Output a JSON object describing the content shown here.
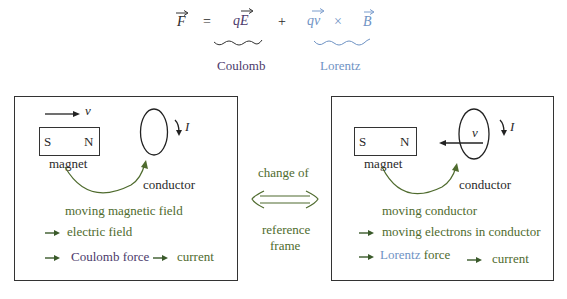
{
  "equation": {
    "lhs": "F",
    "equals": "=",
    "term1": "qE",
    "plus": "+",
    "term2a": "qv",
    "times": "×",
    "term2b": "B",
    "label1": "Coulomb",
    "label2": "Lorentz"
  },
  "colors": {
    "coulomb": "#4b3a6b",
    "lorentz": "#6f93c4",
    "green_text": "#4f6b2e",
    "dark": "#2a2a2a"
  },
  "left_panel": {
    "velocity_label": "v",
    "magnet_south": "S",
    "magnet_north": "N",
    "magnet_label": "magnet",
    "conductor_label": "conductor",
    "current_label": "I",
    "line1": "moving magnetic field",
    "line2": "electric field",
    "line3_force": "Coulomb",
    "line3_force_suffix": "force",
    "line3_result": "current"
  },
  "center": {
    "top": "change of",
    "bottom1": "reference",
    "bottom2": "frame"
  },
  "right_panel": {
    "velocity_label": "v",
    "magnet_south": "S",
    "magnet_north": "N",
    "magnet_label": "magnet",
    "conductor_label": "conductor",
    "current_label": "I",
    "line1": "moving conductor",
    "line2": "moving electrons in conductor",
    "line3_force": "Lorentz",
    "line3_force_suffix": "force",
    "line3_result": "current"
  }
}
